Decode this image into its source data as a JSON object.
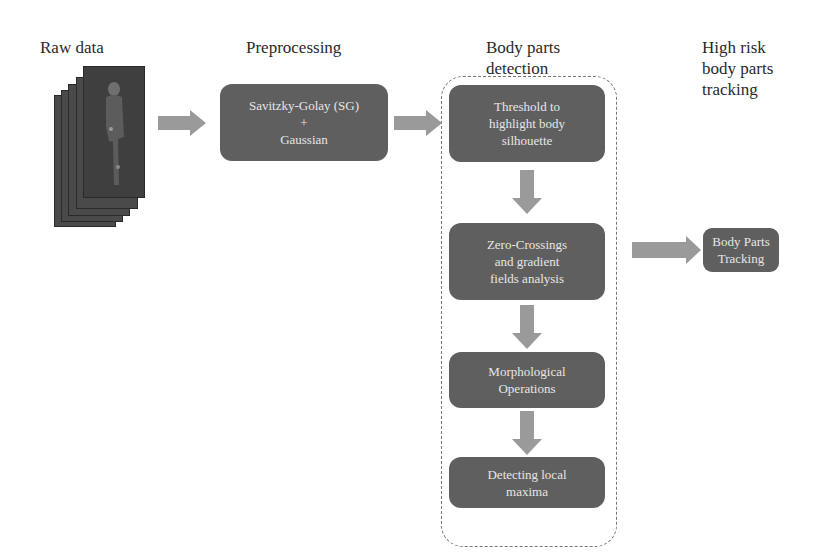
{
  "stages": {
    "raw": {
      "title": "Raw data"
    },
    "pre": {
      "title": "Preprocessing",
      "box_lines": [
        "Savitzky-Golay (SG)",
        "+",
        "Gaussian"
      ]
    },
    "detect": {
      "title_lines": [
        "Body parts",
        "detection"
      ],
      "steps": [
        {
          "lines": [
            "Threshold to",
            "highlight body",
            "silhouette"
          ]
        },
        {
          "lines": [
            "Zero-Crossings",
            "and gradient",
            "fields analysis"
          ]
        },
        {
          "lines": [
            "Morphological",
            "Operations"
          ]
        },
        {
          "lines": [
            "Detecting local",
            "maxima"
          ]
        }
      ]
    },
    "track": {
      "title_lines": [
        "High risk",
        "body parts",
        "tracking"
      ],
      "box_lines": [
        "Body Parts",
        "Tracking"
      ]
    }
  },
  "colors": {
    "box": "#5f5f5f",
    "arrow": "#9a9a9a",
    "frame": "#4a4a4a",
    "text_on_box": "#e6e6e6"
  }
}
